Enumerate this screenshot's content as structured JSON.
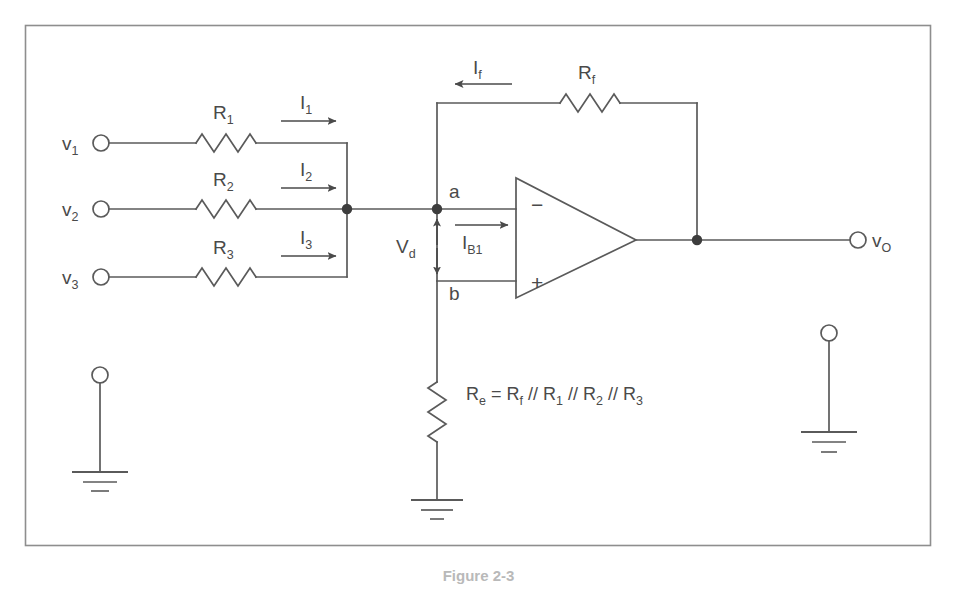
{
  "figure": {
    "caption": "Figure 2-3",
    "frame_color": "#888888",
    "line_color": "#5a5a5a",
    "text_color": "#4a4a4a",
    "background": "#ffffff"
  },
  "inputs": [
    {
      "terminal_label": "v",
      "terminal_sub": "1",
      "resistor_label": "R",
      "resistor_sub": "1",
      "current_label": "I",
      "current_sub": "1"
    },
    {
      "terminal_label": "v",
      "terminal_sub": "2",
      "resistor_label": "R",
      "resistor_sub": "2",
      "current_label": "I",
      "current_sub": "2"
    },
    {
      "terminal_label": "v",
      "terminal_sub": "3",
      "resistor_label": "R",
      "resistor_sub": "3",
      "current_label": "I",
      "current_sub": "3"
    }
  ],
  "feedback": {
    "resistor_label": "R",
    "resistor_sub": "f",
    "current_label": "I",
    "current_sub": "f",
    "current_direction": "left"
  },
  "opamp": {
    "inverting_symbol": "−",
    "noninverting_symbol": "+",
    "node_a": "a",
    "node_b": "b",
    "differential_label": "V",
    "differential_sub": "d",
    "bias_current_label": "I",
    "bias_current_sub": "B1"
  },
  "output": {
    "terminal_label": "v",
    "terminal_sub": "O"
  },
  "compensation": {
    "equation": "R",
    "equation_sub": "e",
    "equation_rest": " = R",
    "eq_sub_f": "f",
    "eq_sep1": " // R",
    "eq_sub_1": "1",
    "eq_sep2": " // R",
    "eq_sub_2": "2",
    "eq_sep3": " // R",
    "eq_sub_3": "3"
  },
  "grounds": [
    {
      "name": "input-reference-ground",
      "has_terminal": true
    },
    {
      "name": "compensation-ground",
      "has_terminal": false
    },
    {
      "name": "output-reference-ground",
      "has_terminal": true
    }
  ]
}
